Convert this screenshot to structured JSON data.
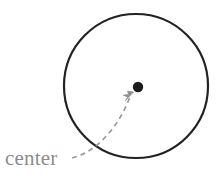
{
  "figure": {
    "background_color": "#ffffff",
    "width": 223,
    "height": 178,
    "annotation_label": "center",
    "label_color": "#8c8c8c",
    "stroke_color": "#222222",
    "pointer_color": "#9a9a9a",
    "dot_color": "#1c1c1c",
    "circle": {
      "center_x": 136,
      "center_y": 86,
      "radius": 72,
      "stroke_width": 2.2
    },
    "center_dot": {
      "x": 138,
      "y": 87,
      "radius": 5.2
    },
    "leader_line": {
      "style": "dashed-curve",
      "dash_pattern": "5 4",
      "stroke_width": 1.6,
      "path": "M 72 158 C 96 152 118 128 130 97",
      "arrowhead_tip_x": 133,
      "arrowhead_tip_y": 93
    },
    "label_position": {
      "x": 5,
      "y": 165
    }
  }
}
